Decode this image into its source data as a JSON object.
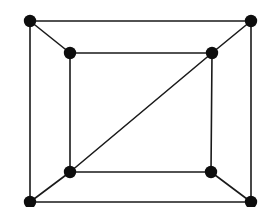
{
  "figure": {
    "width": 269,
    "height": 207,
    "background_color": "#ffffff"
  },
  "style": {
    "edge_color": "#1a1a1a",
    "edge_width": 1.6,
    "vertex_color": "#0d0d0d",
    "vertex_radius": 6.2
  },
  "graph": {
    "vertex_count": 8,
    "edge_count": 13,
    "vertices": [
      {
        "id": "outer-top-left",
        "label": "",
        "x": 30,
        "y": 21
      },
      {
        "id": "outer-top-right",
        "label": "",
        "x": 251,
        "y": 21
      },
      {
        "id": "outer-bottom-right",
        "label": "",
        "x": 251,
        "y": 202
      },
      {
        "id": "outer-bottom-left",
        "label": "",
        "x": 30,
        "y": 202
      },
      {
        "id": "inner-top-left",
        "label": "",
        "x": 70,
        "y": 53
      },
      {
        "id": "inner-top-right",
        "label": "",
        "x": 212,
        "y": 53
      },
      {
        "id": "inner-bottom-right",
        "label": "",
        "x": 211,
        "y": 172
      },
      {
        "id": "inner-bottom-left",
        "label": "",
        "x": 70,
        "y": 172
      }
    ],
    "edges": [
      {
        "id": "outer-top",
        "from": "outer-top-left",
        "to": "outer-top-right"
      },
      {
        "id": "outer-right",
        "from": "outer-top-right",
        "to": "outer-bottom-right"
      },
      {
        "id": "outer-bottom",
        "from": "outer-bottom-right",
        "to": "outer-bottom-left"
      },
      {
        "id": "outer-left",
        "from": "outer-bottom-left",
        "to": "outer-top-left"
      },
      {
        "id": "inner-top",
        "from": "inner-top-left",
        "to": "inner-top-right"
      },
      {
        "id": "inner-right",
        "from": "inner-top-right",
        "to": "inner-bottom-right"
      },
      {
        "id": "inner-bottom",
        "from": "inner-bottom-right",
        "to": "inner-bottom-left"
      },
      {
        "id": "inner-left",
        "from": "inner-bottom-left",
        "to": "inner-top-left"
      },
      {
        "id": "connector-top-left",
        "from": "outer-top-left",
        "to": "inner-top-left"
      },
      {
        "id": "connector-top-right",
        "from": "outer-top-right",
        "to": "inner-top-right"
      },
      {
        "id": "connector-bottom-right",
        "from": "outer-bottom-right",
        "to": "inner-bottom-right"
      },
      {
        "id": "connector-bottom-left",
        "from": "outer-bottom-left",
        "to": "inner-bottom-left"
      },
      {
        "id": "diagonal-chord",
        "from": "inner-bottom-left",
        "to": "inner-top-right"
      }
    ]
  }
}
